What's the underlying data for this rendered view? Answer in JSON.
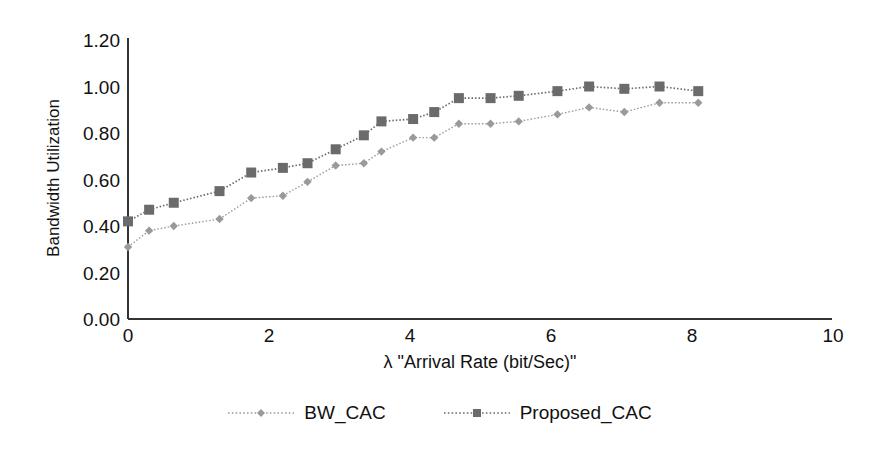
{
  "chart_data": {
    "type": "line",
    "title": "",
    "subtitle": "",
    "xlabel": "λ \"Arrival Rate (bit/Sec)\"",
    "ylabel": "Bandwidth Utilization",
    "xlim": [
      0,
      10
    ],
    "ylim": [
      0,
      1.2
    ],
    "grid": false,
    "legend_position": "bottom",
    "xticks": [
      "0",
      "2",
      "4",
      "6",
      "8",
      "10"
    ],
    "xtick_values": [
      0,
      2,
      4,
      6,
      8,
      10
    ],
    "yticks": [
      "0.00",
      "0.20",
      "0.40",
      "0.60",
      "0.80",
      "1.00",
      "1.20"
    ],
    "ytick_values": [
      0.0,
      0.2,
      0.4,
      0.6,
      0.8,
      1.0,
      1.2
    ],
    "series": [
      {
        "name": "BW_CAC",
        "color": "#9a9a9a",
        "line_style": "dotted",
        "marker": "diamond",
        "x": [
          0.0,
          0.3,
          0.65,
          1.3,
          1.75,
          2.2,
          2.55,
          2.95,
          3.35,
          3.6,
          4.05,
          4.35,
          4.7,
          5.15,
          5.55,
          6.1,
          6.55,
          7.05,
          7.55,
          8.1
        ],
        "y": [
          0.31,
          0.38,
          0.4,
          0.43,
          0.52,
          0.53,
          0.59,
          0.66,
          0.67,
          0.72,
          0.78,
          0.78,
          0.84,
          0.84,
          0.85,
          0.88,
          0.91,
          0.89,
          0.93,
          0.93
        ]
      },
      {
        "name": "Proposed_CAC",
        "color": "#6b6b6b",
        "line_style": "dotted",
        "marker": "square",
        "x": [
          0.0,
          0.3,
          0.65,
          1.3,
          1.75,
          2.2,
          2.55,
          2.95,
          3.35,
          3.6,
          4.05,
          4.35,
          4.7,
          5.15,
          5.55,
          6.1,
          6.55,
          7.05,
          7.55,
          8.1
        ],
        "y": [
          0.42,
          0.47,
          0.5,
          0.55,
          0.63,
          0.65,
          0.67,
          0.73,
          0.79,
          0.85,
          0.86,
          0.89,
          0.95,
          0.95,
          0.96,
          0.98,
          1.0,
          0.99,
          1.0,
          0.98
        ]
      }
    ]
  },
  "axes": {
    "ylabel_text": "Bandwidth Utilization",
    "xlabel_text": "λ \"Arrival Rate (bit/Sec)\""
  },
  "legend": {
    "entries": [
      {
        "label": "BW_CAC",
        "swatch": "dotted-line-diamond-marker"
      },
      {
        "label": "Proposed_CAC",
        "swatch": "dotted-line-square-marker"
      }
    ]
  },
  "colors": {
    "axis": "#333333",
    "bw_cac": "#9a9a9a",
    "proposed_cac": "#6b6b6b",
    "text": "#111111",
    "background": "#ffffff"
  }
}
